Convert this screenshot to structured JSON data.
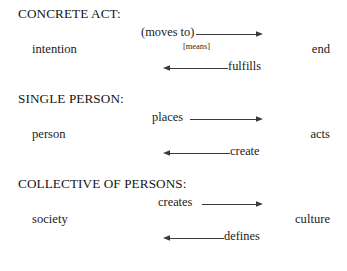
{
  "document": {
    "type": "conceptual-diagram",
    "background_color": "#ffffff",
    "text_color": "#1c1c1c",
    "line_color": "#3a3a3a"
  },
  "sections": [
    {
      "heading": "CONCRETE ACT:",
      "left_term": "intention",
      "right_term": "end",
      "forward_label": "(moves to)",
      "forward_direction": "right",
      "backward_label": "fulfills",
      "backward_direction": "left",
      "annotation": "[means]"
    },
    {
      "heading": "SINGLE PERSON:",
      "left_term": "person",
      "right_term": "acts",
      "forward_label": "places",
      "forward_direction": "right",
      "backward_label": "create",
      "backward_direction": "left",
      "annotation": ""
    },
    {
      "heading": "COLLECTIVE OF PERSONS:",
      "left_term": "society",
      "right_term": "culture",
      "forward_label": "creates",
      "forward_direction": "right",
      "backward_label": "defines",
      "backward_direction": "left",
      "annotation": ""
    }
  ]
}
